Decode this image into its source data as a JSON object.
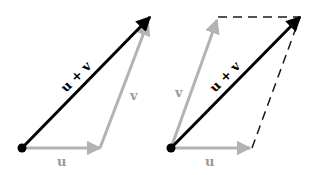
{
  "figures": [
    {
      "name": "triangle-rule",
      "labels": {
        "u": "u",
        "v": "v",
        "sum": "u + v"
      }
    },
    {
      "name": "parallelogram-rule",
      "labels": {
        "u": "u",
        "v": "v",
        "sum": "u + v"
      }
    }
  ],
  "colors": {
    "sum_vector": "#000000",
    "component_vector": "#b3b3b3",
    "dashed_edge": "#1a1a1a",
    "label_gray": "#9a9a9a",
    "background": "#ffffff"
  }
}
